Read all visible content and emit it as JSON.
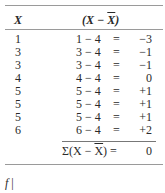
{
  "table": {
    "headers": {
      "x": "X",
      "dev_prefix": "(X − ",
      "dev_bar": "X",
      "dev_suffix": ")"
    },
    "rows": [
      {
        "x": "1",
        "expr": "1 − 4",
        "eq": "=",
        "result": "−3"
      },
      {
        "x": "3",
        "expr": "3 − 4",
        "eq": "=",
        "result": "−1"
      },
      {
        "x": "3",
        "expr": "3 − 4",
        "eq": "=",
        "result": "−1"
      },
      {
        "x": "4",
        "expr": "4 − 4",
        "eq": "=",
        "result": "0"
      },
      {
        "x": "5",
        "expr": "5 − 4",
        "eq": "=",
        "result": "+1"
      },
      {
        "x": "5",
        "expr": "5 − 4",
        "eq": "=",
        "result": "+1"
      },
      {
        "x": "5",
        "expr": "5 − 4",
        "eq": "=",
        "result": "+1"
      },
      {
        "x": "6",
        "expr": "6 − 4",
        "eq": "=",
        "result": "+2"
      }
    ],
    "sum": {
      "prefix": "Σ(X − ",
      "bar": "X",
      "suffix": ") =",
      "result": "0"
    }
  },
  "footer": {
    "text": "f",
    "bar": "|"
  }
}
